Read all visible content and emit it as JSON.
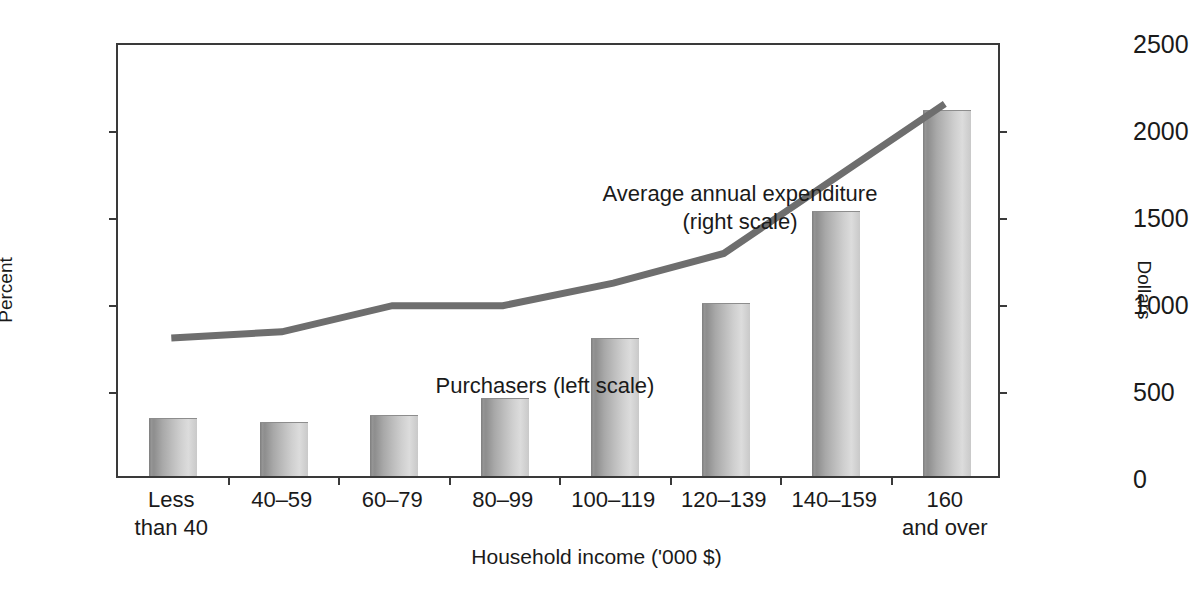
{
  "chart_data": {
    "type": "bar",
    "title": "",
    "subtitle": "",
    "xlabel": "Household income ('000 $)",
    "ylabel": "Percent",
    "y2label": "Dollars",
    "categories": [
      "Less\nthan 40",
      "40–59",
      "60–79",
      "80–99",
      "100–119",
      "120–139",
      "140–159",
      "160\nand over"
    ],
    "ylim": [
      0,
      50
    ],
    "yticks": [
      0,
      10,
      20,
      30,
      40,
      50
    ],
    "ytick_labels": [
      "0",
      "10",
      "20",
      "30",
      "40",
      "50"
    ],
    "y2lim": [
      0,
      2500
    ],
    "y2ticks": [
      0,
      500,
      1000,
      1500,
      2000,
      2500
    ],
    "y2tick_labels": [
      "0",
      "500",
      "1000",
      "1500",
      "2000",
      "2500"
    ],
    "grid": false,
    "legend_position": "inline-annotations",
    "series": [
      {
        "name": "Purchasers (left scale)",
        "type": "bar",
        "axis": "left",
        "unit": "percent",
        "values": [
          6.6,
          6.1,
          6.9,
          8.9,
          15.8,
          19.8,
          30.4,
          42.0
        ]
      },
      {
        "name": "Average annual expenditure (right scale)",
        "type": "line",
        "axis": "right",
        "unit": "dollars",
        "values": [
          805,
          840,
          990,
          990,
          1120,
          1290,
          1720,
          2150
        ]
      }
    ],
    "annotations": [
      {
        "id": "line-label",
        "text": "Average annual expenditure\n(right scale)"
      },
      {
        "id": "bars-label",
        "text": "Purchasers (left scale)"
      }
    ],
    "colors": {
      "line": "#6e6e6e",
      "bar_dark": "#8e8e8e",
      "bar_light": "#dcdcdc",
      "axis": "#3a3a3a",
      "text": "#1a1a1a",
      "background": "#ffffff"
    }
  }
}
